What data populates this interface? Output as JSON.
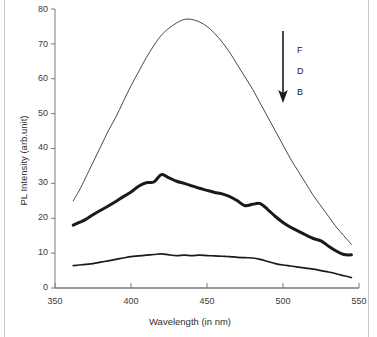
{
  "chart_data": {
    "type": "line",
    "title": "",
    "xlabel": "Wavelength (in nm)",
    "ylabel": "PL Intensity (arb.unit)",
    "xlim": [
      350,
      550
    ],
    "ylim": [
      0,
      80
    ],
    "xticks": [
      350,
      400,
      450,
      500,
      550
    ],
    "yticks": [
      0,
      10,
      20,
      30,
      40,
      50,
      60,
      70,
      80
    ],
    "grid": false,
    "legend_position": "inside-right",
    "annotation": {
      "arrow": "down-arrow",
      "labels": [
        "F",
        "D",
        "B"
      ],
      "meaning": "intensity decreases in the direction of the arrow"
    },
    "series": [
      {
        "name": "F",
        "line_width": "thin",
        "color": "#333333",
        "x": [
          362,
          366,
          370,
          375,
          380,
          385,
          390,
          395,
          400,
          405,
          410,
          415,
          420,
          425,
          430,
          435,
          440,
          445,
          450,
          455,
          460,
          465,
          470,
          475,
          480,
          485,
          490,
          495,
          500,
          505,
          510,
          515,
          520,
          525,
          530,
          535,
          540,
          545
        ],
        "y": [
          25.0,
          28.0,
          31.5,
          36.0,
          40.5,
          45.0,
          49.0,
          53.5,
          58.0,
          62.0,
          66.0,
          69.5,
          72.5,
          74.5,
          76.0,
          77.0,
          77.0,
          76.3,
          75.0,
          73.0,
          70.5,
          67.5,
          64.0,
          60.5,
          57.0,
          53.0,
          49.0,
          45.0,
          41.0,
          37.0,
          33.5,
          30.0,
          26.5,
          23.5,
          20.5,
          17.5,
          15.0,
          12.5
        ]
      },
      {
        "name": "D",
        "line_width": "thick",
        "color": "#1a1a1a",
        "x": [
          362,
          366,
          370,
          375,
          380,
          385,
          390,
          395,
          400,
          405,
          410,
          415,
          420,
          425,
          430,
          435,
          440,
          445,
          450,
          455,
          460,
          465,
          470,
          475,
          480,
          485,
          490,
          495,
          500,
          505,
          510,
          515,
          520,
          525,
          530,
          535,
          540,
          545
        ],
        "y": [
          18.0,
          18.8,
          19.6,
          21.0,
          22.3,
          23.5,
          24.8,
          26.2,
          27.5,
          29.2,
          30.2,
          30.4,
          32.5,
          31.6,
          30.6,
          30.0,
          29.3,
          28.6,
          28.0,
          27.4,
          27.0,
          26.2,
          25.0,
          23.6,
          24.0,
          24.2,
          22.5,
          20.5,
          18.8,
          17.4,
          16.3,
          15.2,
          14.2,
          13.5,
          12.0,
          10.6,
          9.6,
          9.5
        ]
      },
      {
        "name": "B",
        "line_width": "medium",
        "color": "#1a1a1a",
        "x": [
          362,
          366,
          370,
          375,
          380,
          385,
          390,
          395,
          400,
          405,
          410,
          415,
          420,
          425,
          430,
          435,
          440,
          445,
          450,
          455,
          460,
          465,
          470,
          475,
          480,
          485,
          490,
          495,
          500,
          505,
          510,
          515,
          520,
          525,
          530,
          535,
          540,
          545
        ],
        "y": [
          6.4,
          6.6,
          6.8,
          7.0,
          7.4,
          7.8,
          8.2,
          8.6,
          9.0,
          9.2,
          9.4,
          9.6,
          9.8,
          9.5,
          9.3,
          9.4,
          9.3,
          9.4,
          9.3,
          9.2,
          9.1,
          9.0,
          8.8,
          8.7,
          8.6,
          8.2,
          7.6,
          7.0,
          6.6,
          6.3,
          6.0,
          5.7,
          5.4,
          5.0,
          4.6,
          4.1,
          3.5,
          3.0
        ]
      }
    ]
  },
  "axes": {
    "y_tick_labels": [
      "80",
      "70",
      "60",
      "50",
      "40",
      "30",
      "20",
      "10",
      "0"
    ],
    "x_tick_labels": [
      "350",
      "400",
      "450",
      "500",
      "550"
    ],
    "y_axis_title": "PL Intensity (arb.unit)",
    "x_axis_title": "Wavelength (in nm)"
  },
  "annotation_labels": {
    "top": "F",
    "middle": "D",
    "bottom": "B"
  },
  "colors": {
    "axis": "#7a7a7a",
    "curve": "#1a1a1a",
    "text": "#2e2e2e",
    "border": "#c9c9c9",
    "background": "#ffffff"
  }
}
